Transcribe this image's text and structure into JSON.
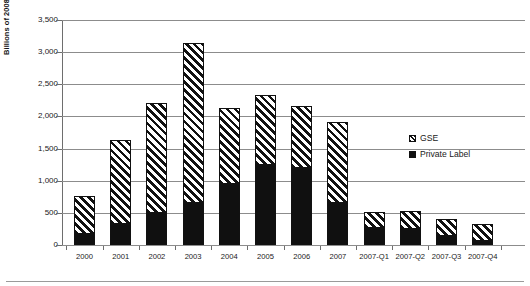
{
  "chart_data": {
    "type": "bar",
    "subtype": "stacked-vertical",
    "title": "",
    "xlabel": "",
    "ylabel": "Billions of 2008 Dollars",
    "ylim": [
      0,
      3500
    ],
    "ytick_interval": 500,
    "ytick_labels": [
      "3,500",
      "3,000",
      "2,500",
      "2,000",
      "1,500",
      "1,000",
      "500",
      "0"
    ],
    "ytick_values": [
      3500,
      3000,
      2500,
      2000,
      1500,
      1000,
      500,
      0
    ],
    "grid": "horizontal",
    "legend_position": "center-right",
    "categories": [
      "2000",
      "2001",
      "2002",
      "2003",
      "2004",
      "2005",
      "2006",
      "2007",
      "2007-Q1",
      "2007-Q2",
      "2007-Q3",
      "2007-Q4"
    ],
    "series": [
      {
        "name": "Private Label",
        "fill": "solid-black",
        "color": "#101010",
        "values": [
          170,
          320,
          500,
          655,
          955,
          1250,
          1200,
          650,
          265,
          250,
          135,
          55
        ]
      },
      {
        "name": "GSE",
        "fill": "diagonal-hatch",
        "color": "#ffffff",
        "values": [
          590,
          1320,
          1710,
          2485,
          1175,
          1090,
          970,
          1270,
          245,
          275,
          265,
          275
        ]
      }
    ],
    "totals": [
      760,
      1640,
      2210,
      3140,
      2130,
      2340,
      2170,
      1920,
      510,
      525,
      400,
      330
    ]
  },
  "legend": {
    "items": [
      {
        "label": "GSE",
        "marker": "hatched-square-icon"
      },
      {
        "label": "Private Label",
        "marker": "filled-square-icon"
      }
    ]
  }
}
